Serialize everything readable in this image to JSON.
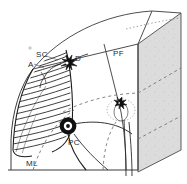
{
  "figure": {
    "background_color": "#ffffff",
    "ink_color": "#2b2b2b",
    "wall_fill": "#d9d9d9",
    "labels": [
      {
        "key": "sc",
        "text": "SC",
        "name": "label-stellate-cell",
        "x": 36,
        "y": 51,
        "meaning": "stellate cell"
      },
      {
        "key": "a",
        "text": "A",
        "name": "label-axon",
        "x": 28,
        "y": 61,
        "meaning": "axon"
      },
      {
        "key": "d",
        "text": "D",
        "name": "label-dendrite",
        "x": 75,
        "y": 55,
        "meaning": "dendrite"
      },
      {
        "key": "pf",
        "text": "PF",
        "name": "label-parallel-fiber",
        "x": 113,
        "y": 50,
        "meaning": "parallel fiber"
      },
      {
        "key": "pc",
        "text": "PC",
        "name": "label-purkinje-cell",
        "x": 68,
        "y": 139,
        "meaning": "Purkinje cell"
      },
      {
        "key": "ml",
        "text": "ML",
        "name": "label-molecular-layer",
        "x": 26,
        "y": 160,
        "meaning": "molecular layer"
      }
    ],
    "elements": {
      "block": "three-dimensional wedge of cerebellar folium with shaded cut face on the right",
      "purkinje_cell": "large soma with fan of dendrites drawn as dense parallel hatching",
      "stellate_cell": "small dark star-shaped interneuron near the pial surface",
      "basket_cell": "second small dark neuron inside dotted ellipse at mid-right",
      "parallel_fibers": "fibers running through the molecular layer toward the cut face",
      "dashed_arcs": "dashed contour lines marking layer boundaries",
      "axons": "curved lines descending to the bottom edge"
    }
  }
}
